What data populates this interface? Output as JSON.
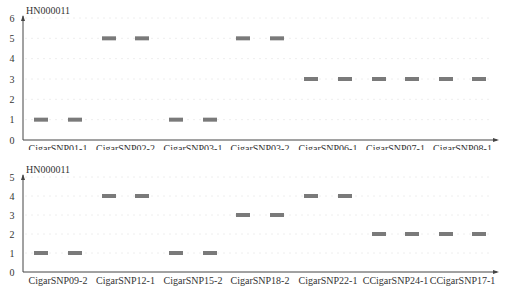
{
  "chart_data": [
    {
      "type": "scatter",
      "title": "HN000011",
      "xlabel": "",
      "ylabel": "",
      "ylim": [
        0,
        6
      ],
      "yticks": [
        0,
        1,
        2,
        3,
        4,
        5,
        6
      ],
      "grid": false,
      "legend": null,
      "categories": [
        "CigarSNP01-1",
        "CigarSNP02-2",
        "CigarSNP03-1",
        "CigarSNP03-2",
        "CigarSNP06-1",
        "CigarSNP07-1",
        "CigarSNP08-1"
      ],
      "points_per_category": 2,
      "values": [
        1,
        1,
        5,
        5,
        1,
        1,
        5,
        5,
        3,
        3,
        3,
        3,
        3,
        3
      ],
      "marker": "horizontal-dash",
      "marker_color": "#7a7a7a"
    },
    {
      "type": "scatter",
      "title": "HN000011",
      "xlabel": "",
      "ylabel": "",
      "ylim": [
        0,
        5
      ],
      "yticks": [
        0,
        1,
        2,
        3,
        4,
        5
      ],
      "grid": false,
      "legend": null,
      "categories": [
        "CigarSNP09-2",
        "CigarSNP12-1",
        "CigarSNP15-2",
        "CigarSNP18-2",
        "CigarSNP22-1",
        "CCigarSNP24-1",
        "CCigarSNP17-1"
      ],
      "points_per_category": 2,
      "values": [
        1,
        1,
        4,
        4,
        1,
        1,
        3,
        3,
        4,
        4,
        2,
        2,
        2,
        2
      ],
      "marker": "horizontal-dash",
      "marker_color": "#7a7a7a"
    }
  ],
  "panels": [
    {
      "title": "HN000011",
      "yticks": [
        "0",
        "1",
        "2",
        "3",
        "4",
        "5",
        "6"
      ],
      "xlabels": [
        "CigarSNP01-1",
        "CigarSNP02-2",
        "CigarSNP03-1",
        "CigarSNP03-2",
        "CigarSNP06-1",
        "CigarSNP07-1",
        "CigarSNP08-1"
      ]
    },
    {
      "title": "HN000011",
      "yticks": [
        "0",
        "1",
        "2",
        "3",
        "4",
        "5"
      ],
      "xlabels": [
        "CigarSNP09-2",
        "CigarSNP12-1",
        "CigarSNP15-2",
        "CigarSNP18-2",
        "CigarSNP22-1",
        "CCigarSNP24-1",
        "CCigarSNP17-1"
      ]
    }
  ],
  "colors": {
    "marker": "#7a7a7a",
    "axis": "#444444",
    "text": "#333333"
  }
}
